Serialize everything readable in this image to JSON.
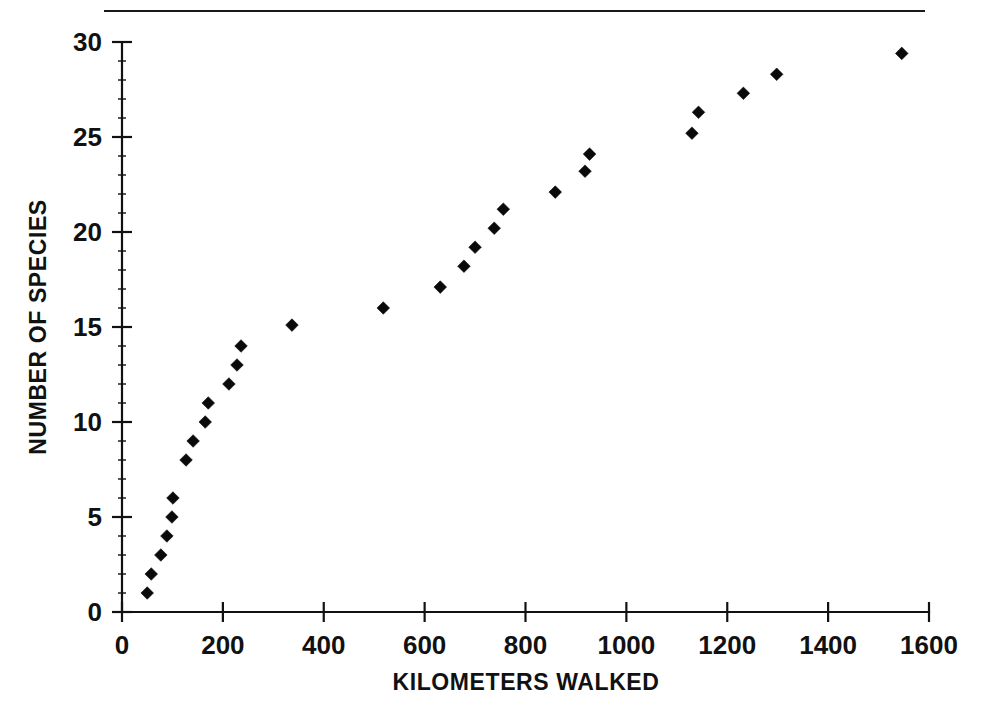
{
  "figure": {
    "name": "species-accumulation-scatter",
    "top_rule": true,
    "background_color": "#ffffff",
    "ink_color": "#0a0a0a"
  },
  "chart_data": {
    "type": "scatter",
    "title": "",
    "subtitle": "",
    "xlabel": "KILOMETERS WALKED",
    "ylabel": "NUMBER OF SPECIES",
    "xlim": [
      0,
      1600
    ],
    "ylim": [
      0,
      30
    ],
    "xticks": [
      0,
      200,
      400,
      600,
      800,
      1000,
      1200,
      1400,
      1600
    ],
    "xticklabels": [
      "0",
      "200",
      "400",
      "600",
      "800",
      "1000",
      "1200",
      "1400",
      "1600"
    ],
    "yticks": [
      0,
      5,
      10,
      15,
      20,
      25,
      30
    ],
    "yticklabels": [
      "0",
      "5",
      "10",
      "15",
      "20",
      "25",
      "30"
    ],
    "minor_tick_step_y": 1,
    "grid": false,
    "legend": null,
    "legend_position": "none",
    "marker": "diamond",
    "marker_size": 11,
    "marker_color": "#0a0a0a",
    "series": [
      {
        "name": "species accumulation",
        "x": [
          50,
          58,
          77,
          89,
          99,
          101,
          127,
          141,
          165,
          171,
          212,
          228,
          236,
          337,
          518,
          631,
          678,
          700,
          738,
          756,
          859,
          918,
          927,
          1130,
          1143,
          1232,
          1298,
          1546
        ],
        "y": [
          1.0,
          2.0,
          3.0,
          4.0,
          5.0,
          6.0,
          8.0,
          9.0,
          10.0,
          11.0,
          12.0,
          13.0,
          14.0,
          15.1,
          16.0,
          17.1,
          18.2,
          19.2,
          20.2,
          21.2,
          22.1,
          23.2,
          24.1,
          25.2,
          26.3,
          27.3,
          28.3,
          29.4
        ]
      }
    ],
    "annotations": []
  }
}
